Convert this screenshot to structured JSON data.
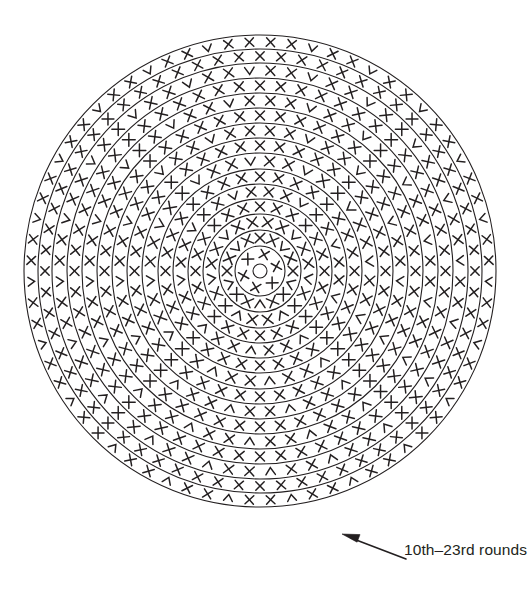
{
  "figure": {
    "background_color": "#ffffff",
    "ink_color": "#231f20",
    "width": 529,
    "height": 589
  },
  "annotation": {
    "label": "10th–23rd rounds",
    "arrow": {
      "from_x": 406,
      "from_y": 559,
      "to_x": 342,
      "to_y": 534
    }
  },
  "chart_data": {
    "type": "diagram",
    "subtype": "crochet-round-chart",
    "title": "10th–23rd rounds",
    "center": {
      "x": 260,
      "y": 271
    },
    "outer_radius": 236,
    "stroke_width": 1.1,
    "symbol_legend": [
      {
        "key": "X",
        "name": "single-crochet",
        "glyph": "X"
      },
      {
        "key": "V",
        "name": "increase-chevron",
        "glyph": "V"
      }
    ],
    "hub": {
      "radius": 25,
      "inner_dot_radius": 7,
      "symbol_count": 6,
      "symbol": "X"
    },
    "rings": [
      {
        "round": 10,
        "r_inner": 25,
        "r_outer": 41,
        "stitches": 16,
        "pattern": "XXV"
      },
      {
        "round": 11,
        "r_inner": 41,
        "r_outer": 57,
        "stitches": 20,
        "pattern": "XXV"
      },
      {
        "round": 12,
        "r_inner": 57,
        "r_outer": 72,
        "stitches": 24,
        "pattern": "XXX"
      },
      {
        "round": 13,
        "r_inner": 72,
        "r_outer": 87,
        "stitches": 28,
        "pattern": "XXV"
      },
      {
        "round": 14,
        "r_inner": 87,
        "r_outer": 102,
        "stitches": 32,
        "pattern": "XXX"
      },
      {
        "round": 15,
        "r_inner": 102,
        "r_outer": 118,
        "stitches": 36,
        "pattern": "XXV"
      },
      {
        "round": 16,
        "r_inner": 118,
        "r_outer": 133,
        "stitches": 40,
        "pattern": "XXX"
      },
      {
        "round": 17,
        "r_inner": 133,
        "r_outer": 148,
        "stitches": 44,
        "pattern": "XXV"
      },
      {
        "round": 18,
        "r_inner": 148,
        "r_outer": 163,
        "stitches": 48,
        "pattern": "XXX"
      },
      {
        "round": 19,
        "r_inner": 163,
        "r_outer": 178,
        "stitches": 52,
        "pattern": "XXV"
      },
      {
        "round": 20,
        "r_inner": 178,
        "r_outer": 193,
        "stitches": 56,
        "pattern": "XXX"
      },
      {
        "round": 21,
        "r_inner": 193,
        "r_outer": 208,
        "stitches": 60,
        "pattern": "XXV"
      },
      {
        "round": 22,
        "r_inner": 208,
        "r_outer": 222,
        "stitches": 64,
        "pattern": "XXX"
      },
      {
        "round": 23,
        "r_inner": 222,
        "r_outer": 236,
        "stitches": 68,
        "pattern": "XXV"
      }
    ]
  }
}
